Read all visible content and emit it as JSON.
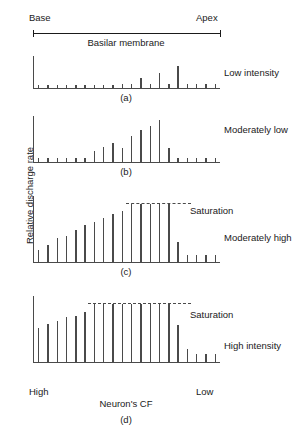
{
  "figure": {
    "y_axis_title": "Relative discharge rate",
    "x_axis_title": "Neuron's CF",
    "x_left_label": "High",
    "x_right_label": "Low"
  },
  "membrane": {
    "base_label": "Base",
    "apex_label": "Apex",
    "caption": "Basilar membrane"
  },
  "saturation_label": "Saturation",
  "panels": {
    "a": {
      "letter": "(a)",
      "intensity": "Low intensity"
    },
    "b": {
      "letter": "(b)",
      "intensity": "Moderately low"
    },
    "c": {
      "letter": "(c)",
      "intensity": "Moderately high"
    },
    "d": {
      "letter": "(d)",
      "intensity": "High intensity"
    }
  },
  "chart_data": [
    {
      "type": "bar",
      "panel": "a",
      "title": "Low intensity",
      "xlabel": "Neuron's CF",
      "ylabel": "Relative discharge rate",
      "x_left_label": "High",
      "x_right_label": "Low",
      "ylim": [
        0,
        100
      ],
      "grid": false,
      "saturation": null,
      "n_bars": 20,
      "categories": [
        "1",
        "2",
        "3",
        "4",
        "5",
        "6",
        "7",
        "8",
        "9",
        "10",
        "11",
        "12",
        "13",
        "14",
        "15",
        "16",
        "17",
        "18",
        "19",
        "20"
      ],
      "values": [
        10,
        10,
        10,
        10,
        10,
        10,
        10,
        10,
        10,
        11,
        11,
        30,
        11,
        47,
        11,
        68,
        11,
        11,
        11,
        11
      ]
    },
    {
      "type": "bar",
      "panel": "b",
      "title": "Moderately low",
      "xlabel": "Neuron's CF",
      "ylabel": "Relative discharge rate",
      "x_left_label": "High",
      "x_right_label": "Low",
      "ylim": [
        0,
        100
      ],
      "grid": false,
      "saturation": null,
      "n_bars": 20,
      "categories": [
        "1",
        "2",
        "3",
        "4",
        "5",
        "6",
        "7",
        "8",
        "9",
        "10",
        "11",
        "12",
        "13",
        "14",
        "15",
        "16",
        "17",
        "18",
        "19",
        "20"
      ],
      "values": [
        9,
        9,
        9,
        9,
        9,
        9,
        25,
        33,
        41,
        30,
        56,
        70,
        78,
        92,
        30,
        9,
        9,
        9,
        9,
        9
      ]
    },
    {
      "type": "bar",
      "panel": "c",
      "title": "Moderately high",
      "xlabel": "Neuron's CF",
      "ylabel": "Relative discharge rate",
      "x_left_label": "High",
      "x_right_label": "Low",
      "ylim": [
        0,
        100
      ],
      "grid": false,
      "saturation": 88,
      "n_bars": 20,
      "categories": [
        "1",
        "2",
        "3",
        "4",
        "5",
        "6",
        "7",
        "8",
        "9",
        "10",
        "11",
        "12",
        "13",
        "14",
        "15",
        "16",
        "17",
        "18",
        "19",
        "20"
      ],
      "values": [
        18,
        26,
        36,
        40,
        48,
        56,
        60,
        66,
        72,
        78,
        88,
        88,
        88,
        88,
        88,
        30,
        10,
        10,
        10,
        10
      ]
    },
    {
      "type": "bar",
      "panel": "d",
      "title": "High intensity",
      "xlabel": "Neuron's CF",
      "ylabel": "Relative discharge rate",
      "x_left_label": "High",
      "x_right_label": "Low",
      "ylim": [
        0,
        100
      ],
      "grid": false,
      "saturation": 88,
      "n_bars": 20,
      "categories": [
        "1",
        "2",
        "3",
        "4",
        "5",
        "6",
        "7",
        "8",
        "9",
        "10",
        "11",
        "12",
        "13",
        "14",
        "15",
        "16",
        "17",
        "18",
        "19",
        "20"
      ],
      "values": [
        52,
        58,
        62,
        68,
        70,
        76,
        88,
        88,
        88,
        88,
        88,
        88,
        88,
        88,
        88,
        56,
        20,
        12,
        12,
        12
      ]
    }
  ]
}
